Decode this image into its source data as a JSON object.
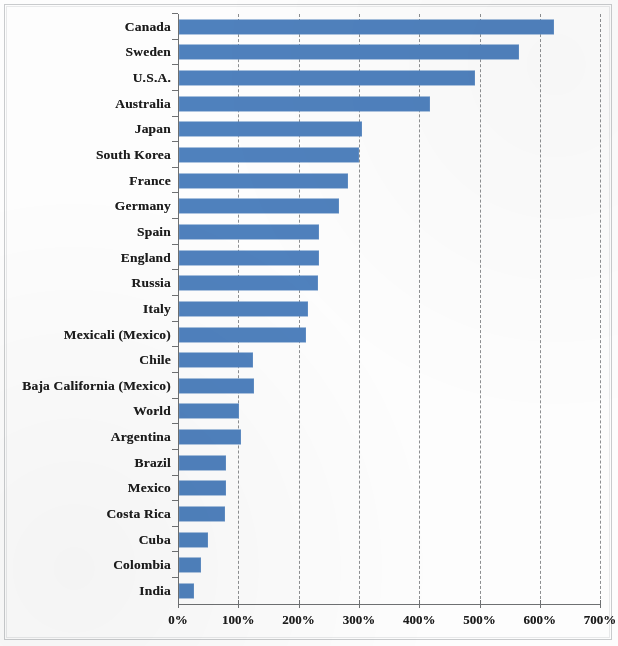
{
  "chart_data": {
    "type": "bar",
    "orientation": "horizontal",
    "title": "",
    "subtitle": "",
    "xlabel": "",
    "ylabel": "",
    "xlim": [
      0,
      700
    ],
    "ylim": null,
    "grid": "vertical-dashed",
    "legend": "none",
    "value_suffix": "%",
    "x_ticks": [
      "0%",
      "100%",
      "200%",
      "300%",
      "400%",
      "500%",
      "600%",
      "700%"
    ],
    "x_tick_values": [
      0,
      100,
      200,
      300,
      400,
      500,
      600,
      700
    ],
    "categories": [
      "Canada",
      "Sweden",
      "U.S.A.",
      "Australia",
      "Japan",
      "South Korea",
      "France",
      "Germany",
      "Spain",
      "England",
      "Russia",
      "Italy",
      "Mexicali (Mexico)",
      "Chile",
      "Baja California (Mexico)",
      "World",
      "Argentina",
      "Brazil",
      "Mexico",
      "Costa Rica",
      "Cuba",
      "Colombia",
      "India"
    ],
    "values": [
      622,
      564,
      491,
      416,
      303,
      298,
      280,
      265,
      232,
      232,
      231,
      214,
      211,
      123,
      124,
      100,
      103,
      78,
      78,
      76,
      48,
      36,
      25
    ],
    "series": [
      {
        "name": "",
        "color": "#4F81BD",
        "values": [
          622,
          564,
          491,
          416,
          303,
          298,
          280,
          265,
          232,
          232,
          231,
          214,
          211,
          123,
          124,
          100,
          103,
          78,
          78,
          76,
          48,
          36,
          25
        ]
      }
    ]
  },
  "colors": {
    "bar": "#4F81BD",
    "gridline": "#8D8F91",
    "axis": "#6E7072",
    "text": "#1C1C1C",
    "page_border": "#C9CBCD",
    "background": "#FDFDFD"
  }
}
